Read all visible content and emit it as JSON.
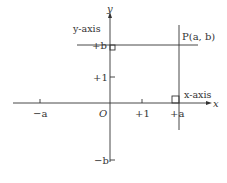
{
  "diagram": {
    "axis_labels": {
      "x": "x",
      "y": "y",
      "x_axis_name": "x-axis",
      "y_axis_name": "y-axis"
    },
    "origin": "O",
    "point": "P(a, b)",
    "ticks": {
      "neg_a": "−a",
      "pos_one_x": "+1",
      "pos_a": "+a",
      "pos_b": "+b",
      "pos_one_y": "+1",
      "neg_b": "−b"
    }
  }
}
